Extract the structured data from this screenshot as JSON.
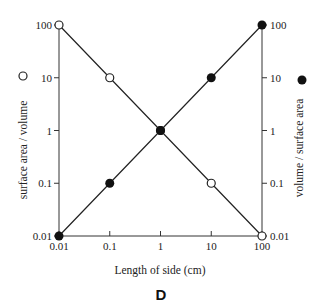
{
  "chart_data": {
    "type": "line",
    "title": "",
    "panel_label": "D",
    "xlabel": "Length of side (cm)",
    "ylabel_left": "surface area / volume",
    "ylabel_right": "volume / surface area",
    "x_scale": "log",
    "y_scale": "log",
    "xlim": [
      0.01,
      100
    ],
    "ylim": [
      0.01,
      100
    ],
    "x_ticks": [
      "0.01",
      "0.1",
      "1",
      "10",
      "100"
    ],
    "y_ticks_left": [
      "0.01",
      "0.1",
      "1",
      "10",
      "100"
    ],
    "y_ticks_right": [
      "0.01",
      "0.1",
      "1",
      "10",
      "100"
    ],
    "grid": false,
    "x": [
      0.01,
      0.1,
      1,
      10,
      100
    ],
    "series": [
      {
        "name": "surface area / volume",
        "marker": "open-circle",
        "axis": "left",
        "values": [
          100,
          10,
          1,
          0.1,
          0.01
        ]
      },
      {
        "name": "volume / surface area",
        "marker": "filled-circle",
        "axis": "right",
        "values": [
          0.01,
          0.1,
          1,
          10,
          100
        ]
      }
    ],
    "legend": {
      "left_axis_marker": "open-circle",
      "right_axis_marker": "filled-circle"
    }
  }
}
